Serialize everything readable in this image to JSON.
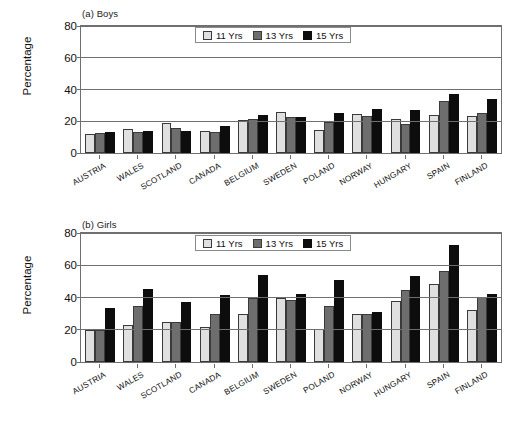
{
  "figure": {
    "background": "#ffffff",
    "axis_color": "#6f6f6f"
  },
  "series_colors": {
    "11 Yrs": "#e0e0e0",
    "13 Yrs": "#6e6e6e",
    "15 Yrs": "#0d0d0d"
  },
  "legend": {
    "position": "top-center-inside",
    "entries": [
      {
        "label": "11 Yrs",
        "color": "#e0e0e0"
      },
      {
        "label": "13 Yrs",
        "color": "#6e6e6e"
      },
      {
        "label": "15 Yrs",
        "color": "#0d0d0d"
      }
    ]
  },
  "panels": [
    {
      "id": "a",
      "title": "(a) Boys",
      "ylabel": "Percentage"
    },
    {
      "id": "b",
      "title": "(b) Girls",
      "ylabel": "Percentage"
    }
  ],
  "yticks": [
    "0",
    "20",
    "40",
    "60",
    "80"
  ],
  "categories": [
    "AUSTRIA",
    "WALES",
    "SCOTLAND",
    "CANADA",
    "BELGIUM",
    "SWEDEN",
    "POLAND",
    "NORWAY",
    "HUNGARY",
    "SPAIN",
    "FINLAND"
  ],
  "chart_data": [
    {
      "type": "bar",
      "title": "(a) Boys",
      "xlabel": "",
      "ylabel": "Percentage",
      "ylim": [
        0,
        80
      ],
      "yticks": [
        0,
        20,
        40,
        60,
        80
      ],
      "grid": true,
      "legend_position": "top-center-inside",
      "categories": [
        "AUSTRIA",
        "WALES",
        "SCOTLAND",
        "CANADA",
        "BELGIUM",
        "SWEDEN",
        "POLAND",
        "NORWAY",
        "HUNGARY",
        "SPAIN",
        "FINLAND"
      ],
      "series": [
        {
          "name": "11 Yrs",
          "color": "#e0e0e0",
          "values": [
            12,
            15,
            19,
            14,
            21,
            26,
            14.5,
            24.5,
            21.5,
            24,
            23.5
          ]
        },
        {
          "name": "13 Yrs",
          "color": "#6e6e6e",
          "values": [
            12.5,
            13,
            16,
            13,
            21.5,
            23,
            19.5,
            23.5,
            18.5,
            32.5,
            25
          ]
        },
        {
          "name": "15 Yrs",
          "color": "#0d0d0d",
          "values": [
            13,
            14,
            14,
            17,
            24,
            22.5,
            25.5,
            27.5,
            27,
            37,
            34
          ]
        }
      ]
    },
    {
      "type": "bar",
      "title": "(b) Girls",
      "xlabel": "",
      "ylabel": "Percentage",
      "ylim": [
        0,
        80
      ],
      "yticks": [
        0,
        20,
        40,
        60,
        80
      ],
      "grid": true,
      "legend_position": "top-center-inside",
      "categories": [
        "AUSTRIA",
        "WALES",
        "SCOTLAND",
        "CANADA",
        "BELGIUM",
        "SWEDEN",
        "POLAND",
        "NORWAY",
        "HUNGARY",
        "SPAIN",
        "FINLAND"
      ],
      "series": [
        {
          "name": "11 Yrs",
          "color": "#e0e0e0",
          "values": [
            20,
            23,
            25,
            22,
            30,
            40,
            20.5,
            29.5,
            38,
            48.5,
            32
          ]
        },
        {
          "name": "13 Yrs",
          "color": "#6e6e6e",
          "values": [
            20,
            34.5,
            25,
            30,
            40,
            38.5,
            34.5,
            30,
            44.5,
            56.5,
            40.5
          ]
        },
        {
          "name": "15 Yrs",
          "color": "#0d0d0d",
          "values": [
            33.5,
            45.5,
            37.5,
            41.5,
            54,
            42,
            51,
            31,
            53.5,
            72.5,
            42
          ]
        }
      ]
    }
  ]
}
